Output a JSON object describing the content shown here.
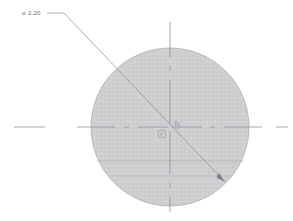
{
  "drawing": {
    "title": "Circular part detail view",
    "type": "cad-technical-drawing",
    "background_color": "#ffffff",
    "units_implied": "inch"
  },
  "dimensions": [
    {
      "id": "diameter-callout",
      "symbol": "⌀",
      "value": "2.20",
      "label": "⌀ 2.20",
      "text_x": 22,
      "text_y": 15,
      "color": "#6e6e72",
      "leader": {
        "shoulder_start_x": 47,
        "shoulder_y": 13,
        "shoulder_end_x": 64,
        "arrow_x": 225,
        "arrow_y": 182,
        "has_arrowhead": true
      }
    }
  ],
  "geometry": {
    "circle": {
      "name": "main-circle",
      "center_x": 170,
      "center_y": 127,
      "radius": 79,
      "fill_color": "#cfcfd2",
      "stroke_color": "#a8a8ac",
      "stroke_width": 0.7
    },
    "chords": [
      {
        "name": "chord-upper",
        "y": 161,
        "color": "#a9a9ad"
      },
      {
        "name": "chord-lower",
        "y": 176,
        "color": "#b4b4b8"
      }
    ],
    "centerlines": {
      "color": "#8e8e93",
      "stroke_width": 0.75,
      "dash_pattern": "long-dash dot",
      "horizontal": {
        "name": "horizontal-centerline",
        "y": 127,
        "x_start": 14,
        "x_end": 288
      },
      "vertical": {
        "name": "vertical-centerline",
        "x": 170,
        "y_start": 22,
        "y_end": 212
      }
    },
    "center_marks": [
      {
        "name": "center-mark-left",
        "x": 162,
        "y": 134
      },
      {
        "name": "center-mark-right",
        "x": 178,
        "y": 125
      }
    ]
  },
  "colors": {
    "part_fill": "#cfcfd2",
    "part_outline": "#a8a8ac",
    "centerline": "#8e8e93",
    "leader": "#8a8a8e",
    "text": "#6e6e72"
  }
}
